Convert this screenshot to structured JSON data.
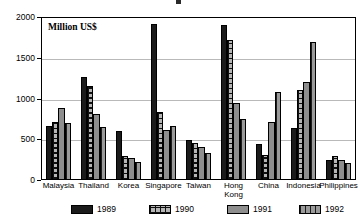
{
  "chart_data": {
    "type": "bar",
    "title": "",
    "subtitle": "",
    "unit_label": "Million US$",
    "xlabel": "",
    "ylabel": "",
    "ylim": [
      0,
      2000
    ],
    "yticks": [
      0,
      500,
      1000,
      1500,
      2000
    ],
    "ytick_labels": [
      "0",
      "500",
      "1000",
      "1500",
      "2000"
    ],
    "grid": true,
    "legend_position": "bottom",
    "categories": [
      "Malaysia",
      "Thailand",
      "Korea",
      "Singapore",
      "Taiwan",
      "Hong\nKong",
      "China",
      "Indonesia",
      "Philippines"
    ],
    "series": [
      {
        "name": "1989",
        "pattern": "solid-black",
        "color": "#1b1b1b",
        "values": [
          660,
          1265,
          600,
          1910,
          490,
          1905,
          440,
          640,
          240
        ]
      },
      {
        "name": "1990",
        "pattern": "grid-crosshatch",
        "color": "#b5b5b5",
        "values": [
          710,
          1150,
          290,
          840,
          450,
          1720,
          310,
          1110,
          290
        ]
      },
      {
        "name": "1991",
        "pattern": "solid-gray",
        "color": "#8e8e8e",
        "values": [
          880,
          805,
          265,
          610,
          400,
          950,
          710,
          1200,
          250
        ]
      },
      {
        "name": "1992",
        "pattern": "vertical-stripes",
        "color": "#9a9a9a",
        "values": [
          695,
          650,
          225,
          665,
          330,
          750,
          1080,
          1690,
          210
        ]
      }
    ]
  },
  "legend": {
    "items": [
      {
        "label": "1989"
      },
      {
        "label": "1990"
      },
      {
        "label": "1991"
      },
      {
        "label": "1992"
      }
    ]
  }
}
